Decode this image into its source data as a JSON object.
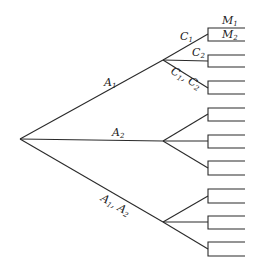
{
  "diagram": {
    "type": "decision-tree",
    "root": {
      "x": 20,
      "y": 139
    },
    "first_level": [
      {
        "id": "A1",
        "label": "A",
        "sub": "1",
        "branch_point": {
          "x": 163,
          "y": 60
        },
        "label_pos": {
          "x": 104,
          "y": 86
        }
      },
      {
        "id": "A2",
        "label": "A",
        "sub": "2",
        "branch_point": {
          "x": 163,
          "y": 141
        },
        "label_pos": {
          "x": 112,
          "y": 136
        }
      },
      {
        "id": "A1A2",
        "label": "A",
        "sub": "1",
        "label2": ", A",
        "sub2": "2",
        "branch_point": {
          "x": 163,
          "y": 222
        },
        "label_pos": {
          "x": 100,
          "y": 200
        }
      }
    ],
    "second_level_labels": {
      "c1": {
        "label": "C",
        "sub": "1"
      },
      "c2": {
        "label": "C",
        "sub": "2"
      },
      "c1c2": {
        "label": "C",
        "sub": "1",
        "label2": ", C",
        "sub2": "2"
      }
    },
    "brackets": [
      {
        "top": 28,
        "bottom": 41
      },
      {
        "top": 55,
        "bottom": 67
      },
      {
        "top": 81,
        "bottom": 94
      },
      {
        "top": 108,
        "bottom": 121
      },
      {
        "top": 135,
        "bottom": 148
      },
      {
        "top": 161,
        "bottom": 175
      },
      {
        "top": 189,
        "bottom": 203
      },
      {
        "top": 216,
        "bottom": 229
      },
      {
        "top": 242,
        "bottom": 256
      }
    ],
    "leaf_labels": {
      "m1": {
        "label": "M",
        "sub": "1"
      },
      "m2": {
        "label": "M",
        "sub": "2"
      }
    }
  }
}
